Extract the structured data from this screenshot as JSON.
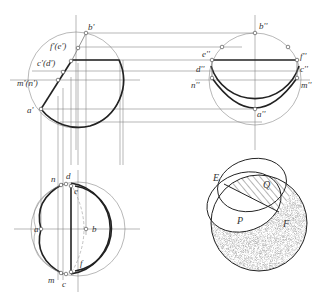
{
  "figure": {
    "front_view": {
      "labels": {
        "b": "b'",
        "fe": "f'(e')",
        "cd": "c'(d')",
        "mn": "m'(n')",
        "a": "a'"
      }
    },
    "side_view": {
      "labels": {
        "b": "b''",
        "e": "e''",
        "f": "f''",
        "d": "d''",
        "c": "c''",
        "n": "n''",
        "m": "m''",
        "a": "a''"
      }
    },
    "top_view": {
      "labels": {
        "n": "n",
        "d": "d",
        "e": "e",
        "a": "a",
        "b": "b",
        "f": "f",
        "m": "m",
        "c": "c"
      }
    },
    "axonometric": {
      "labels": {
        "E": "E",
        "Q": "Q",
        "P": "P",
        "F": "F"
      }
    }
  }
}
